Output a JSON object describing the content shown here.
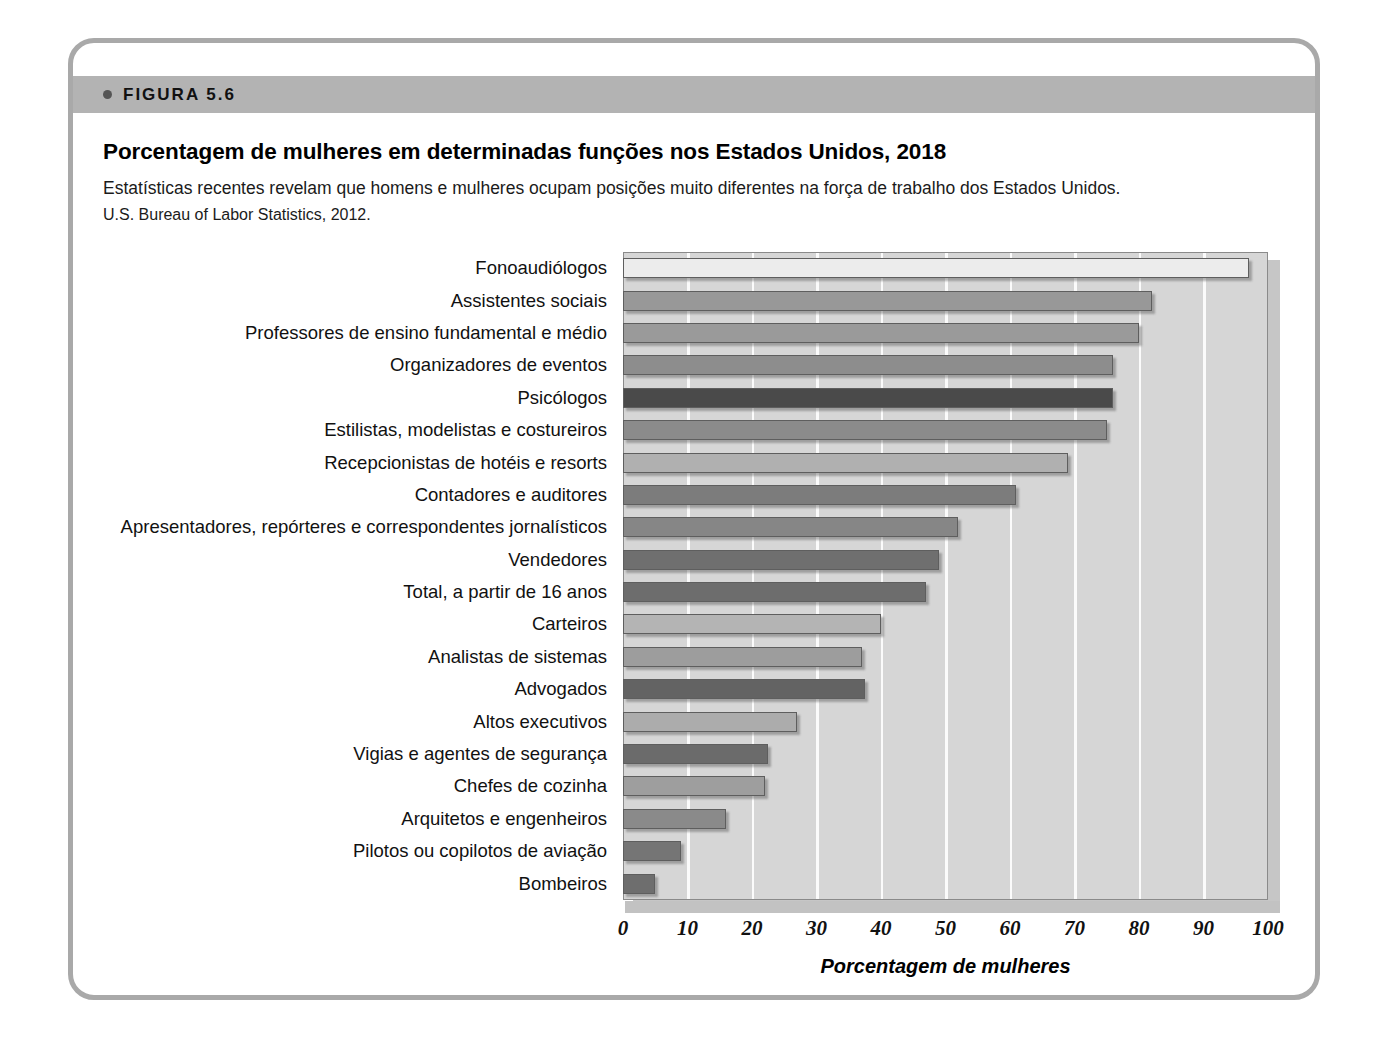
{
  "figure": {
    "band_label": "FIGURA 5.6",
    "title": "Porcentagem de mulheres em determinadas funções nos Estados Unidos, 2018",
    "subtitle": "Estatísticas recentes revelam que homens e mulheres ocupam posições muito diferentes na força de trabalho dos Estados Unidos.",
    "source": "U.S. Bureau of Labor Statistics, 2012."
  },
  "chart_data": {
    "type": "bar",
    "orientation": "horizontal",
    "title": "Porcentagem de mulheres em determinadas funções nos Estados Unidos, 2018",
    "xlabel": "Porcentagem de mulheres",
    "ylabel": "",
    "xlim": [
      0,
      100
    ],
    "xticks": [
      0,
      10,
      20,
      30,
      40,
      50,
      60,
      70,
      80,
      90,
      100
    ],
    "grid": true,
    "legend": "none",
    "categories": [
      "Fonoaudiólogos",
      "Assistentes sociais",
      "Professores de ensino fundamental e médio",
      "Organizadores de eventos",
      "Psicólogos",
      "Estilistas, modelistas e costureiros",
      "Recepcionistas de hotéis e resorts",
      "Contadores e auditores",
      "Apresentadores, repórteres e correspondentes jornalísticos",
      "Vendedores",
      "Total, a partir de 16 anos",
      "Carteiros",
      "Analistas de sistemas",
      "Advogados",
      "Altos executivos",
      "Vigias e agentes de segurança",
      "Chefes de cozinha",
      "Arquitetos e engenheiros",
      "Pilotos ou copilotos de aviação",
      "Bombeiros"
    ],
    "values": [
      97,
      82,
      80,
      76,
      76,
      75,
      69,
      61,
      52,
      49,
      47,
      40,
      37,
      37.5,
      27,
      22.5,
      22,
      16,
      9,
      5
    ],
    "bar_colors": [
      "#ececec",
      "#989898",
      "#9a9a9a",
      "#8d8d8d",
      "#4a4a4a",
      "#8b8b8b",
      "#b0b0b0",
      "#7c7c7c",
      "#868686",
      "#6f6f6f",
      "#6d6d6d",
      "#b4b4b4",
      "#9d9d9d",
      "#636363",
      "#acacac",
      "#6b6b6b",
      "#9e9e9e",
      "#8a8a8a",
      "#757575",
      "#6e6e6e"
    ],
    "plot_background": "#d6d6d6",
    "gridline_color": "#fbfbfb"
  },
  "colors": {
    "frame_border": "#a9a9a9",
    "band_background": "#b3b3b3",
    "text": "#111111"
  }
}
